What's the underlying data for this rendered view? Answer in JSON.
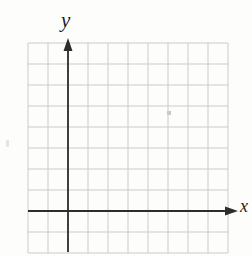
{
  "chart_data": {
    "type": "scatter",
    "title": "",
    "xlabel": "x",
    "ylabel": "y",
    "series": [],
    "annotations": [],
    "grid": true,
    "legend": false,
    "axis_ticks_labeled": false,
    "x_range_cells": [
      -2,
      8
    ],
    "y_range_cells": [
      -2,
      8
    ]
  },
  "layout": {
    "background": "#fdfdfc",
    "label_color": "#1e1e1e",
    "grid": {
      "left": 28,
      "top": 43,
      "cols": 10,
      "rows": 10,
      "cell_w": 20,
      "cell_h": 21,
      "line_color": "#c9cccb",
      "line_width": 1
    },
    "axes": {
      "color": "#2d2d2d",
      "line_width": 1.8,
      "y_axis_col": 2,
      "x_axis_row": 8,
      "y_tip": 38,
      "y_bottom": 252,
      "x_left": 28,
      "x_tip": 238,
      "arrow_len": 13,
      "arrow_half_w": 4.5
    },
    "specks": [
      {
        "x": 167,
        "y": 111,
        "w": 4,
        "h": 4,
        "color": "#c6cac9"
      },
      {
        "x": 6,
        "y": 140,
        "w": 3,
        "h": 7,
        "color": "#e4e4e2"
      }
    ]
  }
}
